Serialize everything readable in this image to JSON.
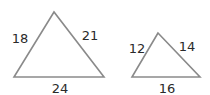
{
  "diagram": {
    "triangles": [
      {
        "name": "large",
        "points": "54,12 14,77 104,77",
        "sides": {
          "left": {
            "label": "18",
            "x": 20,
            "y": 43
          },
          "right": {
            "label": "21",
            "x": 90,
            "y": 40
          },
          "bottom": {
            "label": "24",
            "x": 60,
            "y": 93
          }
        }
      },
      {
        "name": "small",
        "points": "158,33 132,77 200,77",
        "sides": {
          "left": {
            "label": "12",
            "x": 137,
            "y": 53
          },
          "right": {
            "label": "14",
            "x": 187,
            "y": 51
          },
          "bottom": {
            "label": "16",
            "x": 167,
            "y": 93
          }
        }
      }
    ]
  }
}
